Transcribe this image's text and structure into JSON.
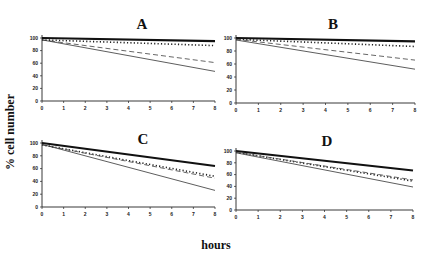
{
  "chart_data": [
    {
      "type": "line",
      "panel": "top-left",
      "title": "A",
      "xlabel": "hours",
      "ylabel": "% cell number",
      "x": [
        0,
        8
      ],
      "xticks": [
        "0",
        "1",
        "2",
        "3",
        "4",
        "5",
        "6",
        "7",
        "8"
      ],
      "yticks": [
        "0",
        "20",
        "40",
        "60",
        "80",
        "100"
      ],
      "xlim": [
        0,
        8
      ],
      "ylim": [
        0,
        100
      ],
      "grid": false,
      "legend": "none",
      "series": [
        {
          "name": "thick-solid",
          "style": "thick-solid",
          "values": [
            100,
            95
          ]
        },
        {
          "name": "dotted",
          "style": "dotted",
          "values": [
            97,
            88
          ]
        },
        {
          "name": "dashed",
          "style": "dashed",
          "values": [
            97,
            61
          ]
        },
        {
          "name": "thin-solid",
          "style": "thin-solid",
          "values": [
            97,
            47
          ]
        }
      ]
    },
    {
      "type": "line",
      "panel": "top-right",
      "title": "B",
      "xlabel": "hours",
      "ylabel": "% cell number",
      "x": [
        0,
        8
      ],
      "xticks": [
        "0",
        "1",
        "2",
        "3",
        "4",
        "5",
        "6",
        "7",
        "8"
      ],
      "yticks": [
        "0",
        "20",
        "40",
        "60",
        "80",
        "100"
      ],
      "xlim": [
        0,
        8
      ],
      "ylim": [
        0,
        100
      ],
      "grid": false,
      "legend": "none",
      "series": [
        {
          "name": "thick-solid",
          "style": "thick-solid",
          "values": [
            100,
            95
          ]
        },
        {
          "name": "dotted",
          "style": "dotted",
          "values": [
            98,
            87
          ]
        },
        {
          "name": "dashed",
          "style": "dashed",
          "values": [
            98,
            66
          ]
        },
        {
          "name": "thin-solid",
          "style": "thin-solid",
          "values": [
            97,
            52
          ]
        }
      ]
    },
    {
      "type": "line",
      "panel": "bottom-left",
      "title": "C",
      "xlabel": "hours",
      "ylabel": "% cell number",
      "x": [
        0,
        8
      ],
      "xticks": [
        "0",
        "1",
        "2",
        "3",
        "4",
        "5",
        "6",
        "7",
        "8"
      ],
      "yticks": [
        "0",
        "20",
        "40",
        "60",
        "80",
        "100"
      ],
      "xlim": [
        0,
        8
      ],
      "ylim": [
        0,
        100
      ],
      "grid": false,
      "legend": "none",
      "series": [
        {
          "name": "thick-solid",
          "style": "thick-solid",
          "values": [
            100,
            64
          ]
        },
        {
          "name": "dotted",
          "style": "dotted",
          "values": [
            97,
            48
          ]
        },
        {
          "name": "dashed",
          "style": "dashed",
          "values": [
            97,
            45
          ]
        },
        {
          "name": "thin-solid",
          "style": "thin-solid",
          "values": [
            98,
            26
          ]
        }
      ]
    },
    {
      "type": "line",
      "panel": "bottom-right",
      "title": "D",
      "xlabel": "hours",
      "ylabel": "% cell number",
      "x": [
        0,
        8
      ],
      "xticks": [
        "0",
        "1",
        "2",
        "3",
        "4",
        "5",
        "6",
        "7",
        "8"
      ],
      "yticks": [
        "0",
        "20",
        "40",
        "60",
        "80",
        "100"
      ],
      "xlim": [
        0,
        8
      ],
      "ylim": [
        0,
        100
      ],
      "grid": false,
      "legend": "none",
      "series": [
        {
          "name": "thick-solid",
          "style": "thick-solid",
          "values": [
            100,
            67
          ]
        },
        {
          "name": "dotted",
          "style": "dotted",
          "values": [
            98,
            49
          ]
        },
        {
          "name": "dashed",
          "style": "dashed",
          "values": [
            98,
            51
          ]
        },
        {
          "name": "thin-solid",
          "style": "thin-solid",
          "values": [
            97,
            39
          ]
        }
      ]
    }
  ],
  "figure": {
    "ylabel": "% cell number",
    "xlabel": "hours"
  }
}
